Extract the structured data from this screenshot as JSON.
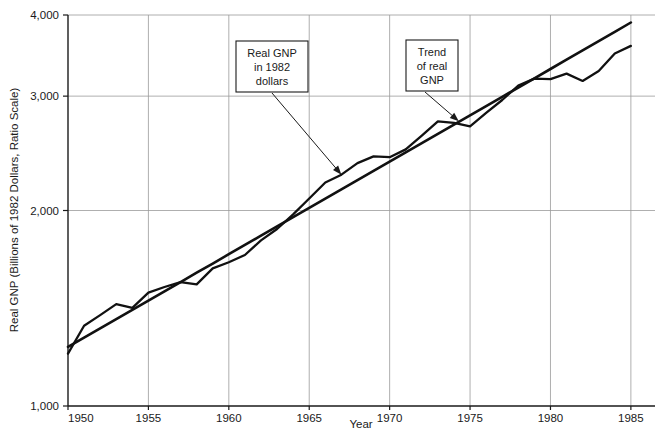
{
  "chart_data": {
    "type": "line",
    "title": "",
    "xlabel": "Year",
    "ylabel": "Real GNP (Billions of 1982 Dollars, Ratio Scale)",
    "scale": "log",
    "grid": true,
    "legend_position": "none",
    "xlim": [
      1950,
      1986.5
    ],
    "ylim": [
      1000,
      4000
    ],
    "xticks": [
      1950,
      1955,
      1960,
      1965,
      1970,
      1975,
      1980,
      1985
    ],
    "xtick_labels": [
      "1950",
      "1955",
      "1960",
      "1965",
      "1970",
      "1975",
      "1980",
      "1985"
    ],
    "yticks": [
      1000,
      2000,
      3000,
      4000
    ],
    "ytick_labels": [
      "1,000",
      "2,000",
      "3,000",
      "4,000"
    ],
    "x": [
      1950,
      1951,
      1952,
      1953,
      1954,
      1955,
      1956,
      1957,
      1958,
      1959,
      1960,
      1961,
      1962,
      1963,
      1964,
      1965,
      1966,
      1967,
      1968,
      1969,
      1970,
      1971,
      1972,
      1973,
      1974,
      1975,
      1976,
      1977,
      1978,
      1979,
      1980,
      1981,
      1982,
      1983,
      1984,
      1985
    ],
    "series": [
      {
        "name": "Real GNP in 1982 dollars",
        "color": "#111111",
        "values": [
          1204,
          1329,
          1380,
          1435,
          1416,
          1495,
          1525,
          1551,
          1539,
          1629,
          1665,
          1708,
          1799,
          1873,
          1973,
          2087,
          2209,
          2271,
          2366,
          2423,
          2416,
          2484,
          2609,
          2744,
          2729,
          2695,
          2827,
          2959,
          3115,
          3192,
          3187,
          3249,
          3166,
          3279,
          3490,
          3585
        ]
      },
      {
        "name": "Trend of real GNP",
        "color": "#111111",
        "values": [
          1233,
          1274,
          1317,
          1361,
          1406,
          1453,
          1502,
          1552,
          1604,
          1657,
          1713,
          1770,
          1829,
          1890,
          1953,
          2018,
          2086,
          2155,
          2227,
          2301,
          2378,
          2457,
          2539,
          2624,
          2712,
          2802,
          2896,
          2993,
          3093,
          3196,
          3303,
          3414,
          3528,
          3646,
          3768,
          3895
        ]
      }
    ],
    "annotations": [
      {
        "id": "real-gnp-callout",
        "lines": [
          "Real GNP",
          "in 1982",
          "dollars"
        ],
        "target_x": 1967,
        "target_y": 2271
      },
      {
        "id": "trend-callout",
        "lines": [
          "Trend",
          "of real",
          "GNP"
        ],
        "target_x": 1974.3,
        "target_y": 2745
      }
    ]
  },
  "axis": {
    "x_title": "Year",
    "y_title": "Real GNP (Billions of 1982 Dollars, Ratio Scale)"
  },
  "colors": {
    "line": "#111111",
    "grid": "#9a9a9a",
    "axis": "#1a1a1a",
    "background": "#ffffff",
    "callout_border": "#1a1a1a"
  }
}
